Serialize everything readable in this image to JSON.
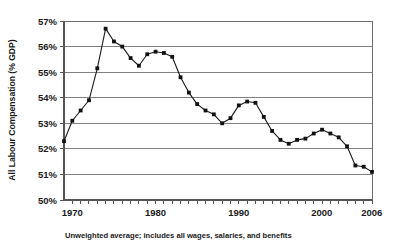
{
  "chart_data": {
    "type": "line",
    "title": "",
    "subtitle": "",
    "xlabel": "",
    "ylabel": "All Labour Compensation (% GDP)",
    "caption": "Unweighted average; includes all wages, salaries, and benefits",
    "xlim": [
      1969,
      2006
    ],
    "ylim": [
      50,
      57
    ],
    "ytick_labels": [
      "57%",
      "56%",
      "55%",
      "54%",
      "53%",
      "52%",
      "51%",
      "50%"
    ],
    "ytick_values": [
      57,
      56,
      55,
      54,
      53,
      52,
      51,
      50
    ],
    "xtick_labels": [
      "1970",
      "1980",
      "1990",
      "2000",
      "2006"
    ],
    "xtick_values": [
      1970,
      1980,
      1990,
      2000,
      2006
    ],
    "xtick_minor_step": 1,
    "grid": "horizontal",
    "legend": "none",
    "marker": "square",
    "series": [
      {
        "name": "All Labour Compensation (% GDP)",
        "x": [
          1969,
          1970,
          1971,
          1972,
          1973,
          1974,
          1975,
          1976,
          1977,
          1978,
          1979,
          1980,
          1981,
          1982,
          1983,
          1984,
          1985,
          1986,
          1987,
          1988,
          1989,
          1990,
          1991,
          1992,
          1993,
          1994,
          1995,
          1996,
          1997,
          1998,
          1999,
          2000,
          2001,
          2002,
          2003,
          2004,
          2005,
          2006
        ],
        "values": [
          52.3,
          53.1,
          53.5,
          53.9,
          55.15,
          56.7,
          56.2,
          56.0,
          55.55,
          55.25,
          55.7,
          55.8,
          55.75,
          55.6,
          54.8,
          54.2,
          53.75,
          53.5,
          53.35,
          53.0,
          53.2,
          53.7,
          53.85,
          53.8,
          53.25,
          52.7,
          52.35,
          52.2,
          52.35,
          52.4,
          52.6,
          52.75,
          52.6,
          52.45,
          52.1,
          51.35,
          51.3,
          51.1
        ]
      }
    ]
  }
}
